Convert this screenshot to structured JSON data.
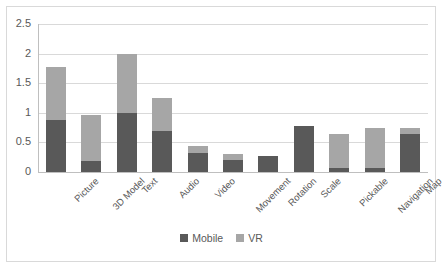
{
  "chart_data": {
    "type": "bar",
    "subtype": "stacked-vertical",
    "title": "",
    "xlabel": "",
    "ylabel": "",
    "ylim": [
      0,
      2.5
    ],
    "grid": true,
    "legend_position": "bottom-center",
    "y_ticks": [
      "0",
      "0.5",
      "1",
      "1.5",
      "2",
      "2.5"
    ],
    "y_tick_values": [
      0,
      0.5,
      1,
      1.5,
      2,
      2.5
    ],
    "categories": [
      "Picture",
      "3D Model",
      "Text",
      "Audio",
      "Video",
      "Movement",
      "Rotation",
      "Scale",
      "Pickable",
      "Navigation",
      "Map"
    ],
    "series": [
      {
        "name": "Mobile",
        "color": "#595959",
        "values": [
          0.88,
          0.19,
          1.0,
          0.7,
          0.32,
          0.21,
          0.27,
          0.77,
          0.06,
          0.06,
          0.64
        ]
      },
      {
        "name": "VR",
        "color": "#a6a6a6",
        "values": [
          0.89,
          0.78,
          1.0,
          0.55,
          0.12,
          0.1,
          0.0,
          0.0,
          0.58,
          0.69,
          0.11
        ]
      }
    ],
    "totals": [
      1.77,
      0.97,
      2.0,
      1.25,
      0.44,
      0.31,
      0.27,
      0.77,
      0.64,
      0.75,
      0.75
    ]
  },
  "legend": {
    "items": [
      {
        "label": "Mobile",
        "color": "#595959"
      },
      {
        "label": "VR",
        "color": "#a6a6a6"
      }
    ]
  },
  "colors": {
    "mobile": "#595959",
    "vr": "#a6a6a6",
    "gridline": "#d9d9d9",
    "axis": "#bfbfbf",
    "frame": "#d9d9d9",
    "text": "#595959",
    "background": "#ffffff"
  }
}
